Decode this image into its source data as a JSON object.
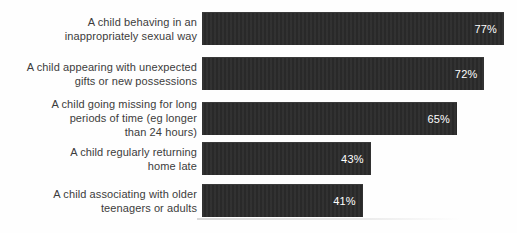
{
  "chart_data": {
    "type": "bar",
    "orientation": "horizontal",
    "title": "",
    "xlabel": "",
    "ylabel": "",
    "categories": [
      "A child behaving in an\ninappropriately sexual way",
      "A child appearing with unexpected\ngifts or new possessions",
      "A child going missing for long\nperiods of time (eg longer\nthan 24 hours)",
      "A child regularly returning\nhome late",
      "A child associating with older\nteenagers or adults"
    ],
    "values": [
      77,
      72,
      65,
      43,
      41
    ],
    "value_labels": [
      "77%",
      "72%",
      "65%",
      "43%",
      "41%"
    ],
    "xlim": [
      0,
      78
    ],
    "grid": false,
    "legend": false,
    "colors": {
      "bar": "#2b2b2b",
      "value_text": "#ffffff",
      "label_text": "#3c3c3c",
      "background": "#fefefe",
      "baseline_shadow": "#b9b9b9"
    }
  }
}
